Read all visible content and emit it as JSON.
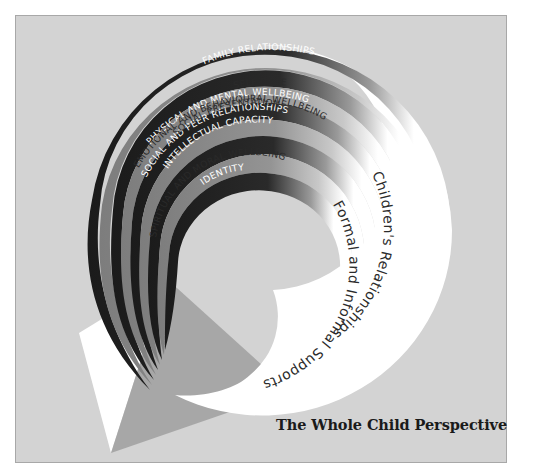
{
  "diagram": {
    "title": "The Whole Child Perspective",
    "bands": [
      {
        "label": "FAMILY RELATIONSHIPS",
        "tone": "dark"
      },
      {
        "label": "SELF CARE",
        "tone": "gray"
      },
      {
        "label": "PHYSICAL AND MENTAL WELLBEING",
        "tone": "dark"
      },
      {
        "label": "EMOTIONAL AND BEHAVIOURAL WELLBEING",
        "tone": "gray"
      },
      {
        "label": "SOCIAL AND PEER RELATIONSHIPS",
        "tone": "dark"
      },
      {
        "label": "SOCIAL PRESENTATION",
        "tone": "gray"
      },
      {
        "label": "INTELLECTUAL CAPACITY",
        "tone": "dark"
      },
      {
        "label": "SPIRITUAL AND MORAL WELLBEING",
        "tone": "gray"
      },
      {
        "label": "IDENTITY",
        "tone": "dark"
      }
    ],
    "swoosh_labels": {
      "outer": "Children's Relationships",
      "inner": "Formal and Informal Supports"
    },
    "colors": {
      "background": "#d3d3d3",
      "dark_band": "#1e1e1e",
      "gray_band": "#8c8c8c",
      "swoosh": "#ffffff",
      "arrow_shadow": "#a9a9a9"
    }
  }
}
